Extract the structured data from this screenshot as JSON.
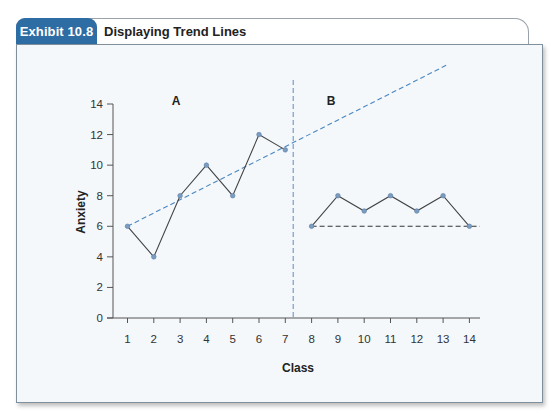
{
  "header": {
    "exhibit_label": "Exhibit 10.8",
    "title": "Displaying Trend Lines",
    "tab_color": "#2e6da4"
  },
  "colors": {
    "panel_bg": "#f4f8fb",
    "data_line": "#444444",
    "marker": "#7a9cc0",
    "trend_a": "#4a86c0",
    "trend_b": "#333333",
    "phase_divider": "#5b8fc4"
  },
  "chart_data": {
    "type": "line",
    "title": "Displaying Trend Lines",
    "xlabel": "Class",
    "ylabel": "Anxiety",
    "xlim": [
      1,
      14
    ],
    "ylim": [
      0,
      14
    ],
    "x_ticks": [
      1,
      2,
      3,
      4,
      5,
      6,
      7,
      8,
      9,
      10,
      11,
      12,
      13,
      14
    ],
    "y_ticks": [
      0,
      2,
      4,
      6,
      8,
      10,
      12,
      14
    ],
    "grid": false,
    "phase_divider_x": 7.3,
    "series": [
      {
        "name": "A",
        "x": [
          1,
          2,
          3,
          4,
          5,
          6,
          7
        ],
        "values": [
          6,
          4,
          8,
          10,
          8,
          12,
          11
        ]
      },
      {
        "name": "B",
        "x": [
          8,
          9,
          10,
          11,
          12,
          13,
          14
        ],
        "values": [
          6,
          8,
          7,
          8,
          7,
          8,
          6
        ]
      }
    ],
    "trend_lines": [
      {
        "phase": "A",
        "style": "dashed",
        "color": "blue",
        "from": [
          1,
          6
        ],
        "to": [
          13.2,
          16.6
        ],
        "description": "Rising trend line from phase A extended across phase B"
      },
      {
        "phase": "B",
        "style": "dashed",
        "color": "black",
        "from": [
          8,
          6
        ],
        "to": [
          14.4,
          6
        ],
        "description": "Flat trend line through phase B baseline"
      }
    ],
    "annotations": [
      "A",
      "B"
    ]
  }
}
